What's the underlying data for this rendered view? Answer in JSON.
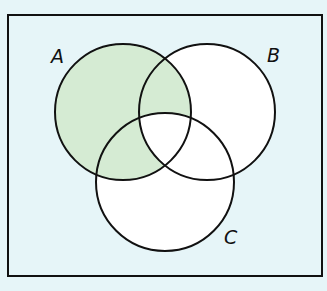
{
  "diagram": {
    "type": "venn",
    "shaded_region": "A minus (B ∩ C)",
    "sets": [
      {
        "label": "A",
        "cx": 123,
        "cy": 112,
        "r": 68
      },
      {
        "label": "B",
        "cx": 207,
        "cy": 112,
        "r": 68
      },
      {
        "label": "C",
        "cx": 165,
        "cy": 182,
        "r": 69
      }
    ],
    "labels": {
      "a": "A",
      "b": "B",
      "c": "C"
    },
    "colors": {
      "background": "#e6f5f8",
      "circle_fill": "#ffffff",
      "shade": "#d5ebd3",
      "stroke": "#111111"
    }
  }
}
